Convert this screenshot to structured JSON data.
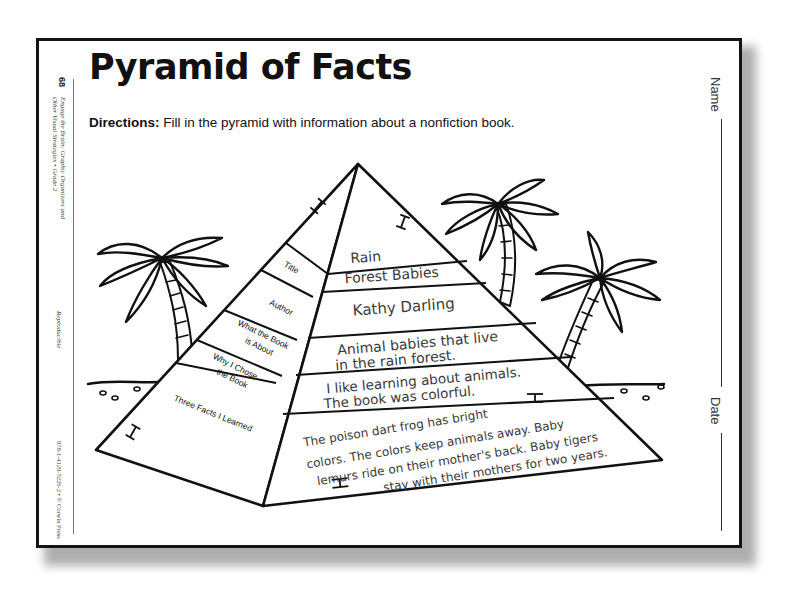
{
  "page": {
    "title": "Pyramid of Facts",
    "directions_label": "Directions:",
    "directions_text": " Fill in the pyramid with information about a nonfiction book.",
    "page_number": "68",
    "series_line1": "Engage the Brain: Graphic Organizers and",
    "series_line2": "Other Visual Strategies • Grade 2",
    "reproducible": "Reproducible",
    "isbn": "978-1-4129-5226-2 • © Corwin Press",
    "name_label": "Name",
    "date_label": "Date"
  },
  "pyramid": {
    "labels": {
      "title": "Title",
      "author": "Author",
      "about_1": "What the Book",
      "about_2": "is About",
      "why_1": "Why I Chose",
      "why_2": "the Book",
      "facts": "Three Facts I Learned"
    },
    "answers": {
      "title_1": "Rain",
      "title_2": "Forest Babies",
      "author": "Kathy Darling",
      "about_1": "Animal babies that live",
      "about_2": "in the rain forest.",
      "why_1": "I like learning about animals.",
      "why_2": "The book was colorful.",
      "facts_1": "The poison dart frog has bright",
      "facts_2": "colors. The colors keep animals away. Baby",
      "facts_3": "lemurs ride on their mother's back. Baby tigers",
      "facts_4": "stay with their mothers for two years."
    },
    "hieroglyph": "H"
  },
  "colors": {
    "ink": "#111111",
    "handwriting": "#3a3a3a",
    "paper": "#ffffff",
    "shadow": "#9a9a9a"
  }
}
